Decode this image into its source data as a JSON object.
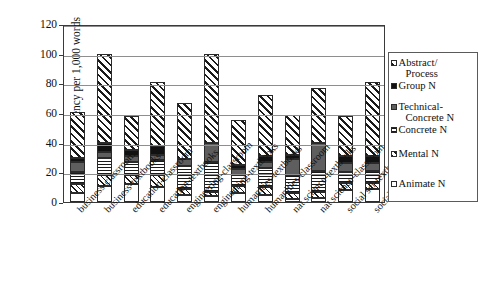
{
  "chart_data": {
    "type": "bar",
    "subtype": "stacked-bar",
    "title": "",
    "xlabel": "",
    "ylabel": "Frequency per 1,000 words",
    "ylim": [
      0,
      120
    ],
    "yticks": [
      0,
      20,
      40,
      60,
      80,
      100,
      120
    ],
    "ytick_labels": [
      "0",
      "20",
      "40",
      "60",
      "80",
      "100",
      "120"
    ],
    "grid": "horizontal",
    "legend_position": "right",
    "categories": [
      "business-classroom",
      "business-textbooks",
      "education-classroom",
      "education-textbooks",
      "engineering-classroom",
      "engineering-textbooks",
      "humanities-textbooks",
      "humanities-classroom",
      "nat science-textbooks",
      "nat science-classroom",
      "social sci-textbooks",
      "social sci-classroom"
    ],
    "series": [
      {
        "name": "Animate N",
        "pattern": "solid-white",
        "color": "#ffffff",
        "values": [
          6,
          11,
          12,
          10,
          5,
          4,
          6,
          5,
          2,
          3,
          8,
          9
        ]
      },
      {
        "name": "Mental N",
        "pattern": "diagonal-hatch-fine",
        "color": "#1a1a1a",
        "values": [
          6,
          7,
          6,
          8,
          4,
          3,
          5,
          5,
          4,
          4,
          5,
          4
        ]
      },
      {
        "name": "Concrete N",
        "pattern": "horizontal-lines",
        "color": "#1a1a1a",
        "values": [
          8,
          12,
          9,
          10,
          15,
          20,
          7,
          13,
          12,
          14,
          7,
          8
        ]
      },
      {
        "name": "Technical-Concrete N",
        "pattern": "solid-gray",
        "color": "#5e5e5e",
        "values": [
          7,
          4,
          4,
          4,
          5,
          13,
          4,
          4,
          11,
          19,
          6,
          5
        ]
      },
      {
        "name": "Group N",
        "pattern": "solid-black",
        "color": "#111111",
        "values": [
          3,
          6,
          4,
          6,
          0,
          0,
          3,
          4,
          3,
          0,
          5,
          5
        ]
      },
      {
        "name": "Abstract/Process",
        "pattern": "diagonal-hatch-coarse",
        "color": "#1a1a1a",
        "values": [
          31,
          60,
          23,
          43,
          38,
          60,
          30,
          41,
          27,
          37,
          27,
          50
        ]
      }
    ],
    "totals": [
      61,
      100,
      58,
      81,
      67,
      100,
      55,
      72,
      59,
      77,
      58,
      81
    ]
  },
  "legend": {
    "entries": [
      {
        "label_line1": "Abstract/",
        "label_line2": "Process",
        "series": "Abstract/Process"
      },
      {
        "label_line1": "Group N",
        "label_line2": "",
        "series": "Group N"
      },
      {
        "label_line1": "Technical-",
        "label_line2": "Concrete N",
        "series": "Technical-Concrete N"
      },
      {
        "label_line1": "Concrete N",
        "label_line2": "",
        "series": "Concrete N"
      },
      {
        "label_line1": "Mental N",
        "label_line2": "",
        "series": "Mental N"
      },
      {
        "label_line1": "Animate N",
        "label_line2": "",
        "series": "Animate N"
      }
    ]
  },
  "axis": {
    "y_title": "Frequency per 1,000 words"
  }
}
